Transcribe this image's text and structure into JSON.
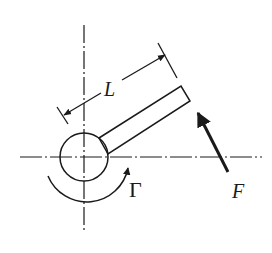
{
  "diagram": {
    "type": "mechanics-free-body-sketch",
    "labels": {
      "length": "L",
      "moment": "Γ",
      "force": "F"
    },
    "colors": {
      "ink": "#1a1a1a",
      "background": "#ffffff"
    },
    "elements": [
      {
        "name": "vertical-centerline",
        "style": "dash-dot"
      },
      {
        "name": "horizontal-centerline",
        "style": "dash-dot"
      },
      {
        "name": "pivot-circle"
      },
      {
        "name": "rod"
      },
      {
        "name": "length-dimension",
        "label": "L"
      },
      {
        "name": "moment-arc",
        "label": "Γ",
        "direction": "counterclockwise"
      },
      {
        "name": "force-arrow",
        "label": "F",
        "direction": "up-left"
      }
    ]
  }
}
